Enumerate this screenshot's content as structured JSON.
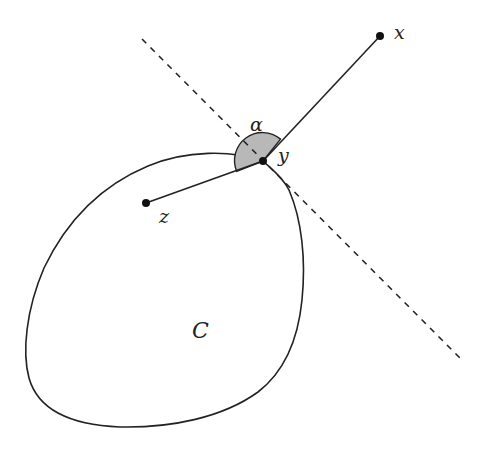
{
  "diagram": {
    "title": "",
    "set_label": "C",
    "points": {
      "x": {
        "label": "x",
        "cx": 380,
        "cy": 36
      },
      "y": {
        "label": "y",
        "cx": 263,
        "cy": 161
      },
      "z": {
        "label": "z",
        "cx": 146,
        "cy": 203
      }
    },
    "angle_label": "α",
    "colors": {
      "stroke": "#222222",
      "sector_fill": "#b8b8b8",
      "background": "#ffffff"
    },
    "supporting_line": {
      "style": "dashed",
      "from": [
        142,
        39
      ],
      "to": [
        462,
        360
      ]
    }
  }
}
